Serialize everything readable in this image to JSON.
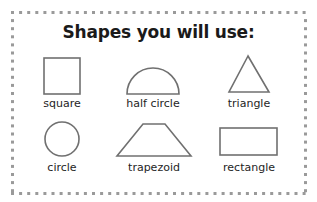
{
  "worksheet": {
    "title": "Shapes you will use:",
    "border_style": "dotted",
    "colors": {
      "border_dots": "#9a9a9a",
      "shape_stroke": "#6e6e6e",
      "text": "#1a1a1a"
    },
    "shapes": [
      {
        "name": "square",
        "label": "square"
      },
      {
        "name": "half-circle",
        "label": "half circle"
      },
      {
        "name": "triangle",
        "label": "triangle"
      },
      {
        "name": "circle",
        "label": "circle"
      },
      {
        "name": "trapezoid",
        "label": "trapezoid"
      },
      {
        "name": "rectangle",
        "label": "rectangle"
      }
    ]
  }
}
